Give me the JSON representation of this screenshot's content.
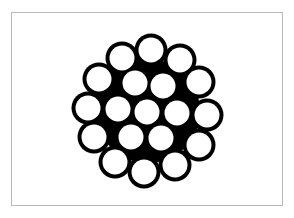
{
  "diagram": {
    "frame_color": "#b8b8b8",
    "fill_color": "#000000",
    "wire_color": "#ffffff",
    "wire_radius": 12.5,
    "outline_width": 4,
    "wires": [
      {
        "cx": 151,
        "cy": 50
      },
      {
        "cx": 122,
        "cy": 58
      },
      {
        "cx": 180,
        "cy": 60
      },
      {
        "cx": 99,
        "cy": 79
      },
      {
        "cx": 199,
        "cy": 82
      },
      {
        "cx": 88,
        "cy": 108
      },
      {
        "cx": 207,
        "cy": 115
      },
      {
        "cx": 94,
        "cy": 137
      },
      {
        "cx": 199,
        "cy": 145
      },
      {
        "cx": 115,
        "cy": 162
      },
      {
        "cx": 175,
        "cy": 165
      },
      {
        "cx": 144,
        "cy": 172
      },
      {
        "cx": 135,
        "cy": 83
      },
      {
        "cx": 163,
        "cy": 86
      },
      {
        "cx": 118,
        "cy": 109
      },
      {
        "cx": 147,
        "cy": 112
      },
      {
        "cx": 177,
        "cy": 113
      },
      {
        "cx": 131,
        "cy": 137
      },
      {
        "cx": 161,
        "cy": 138
      }
    ]
  }
}
